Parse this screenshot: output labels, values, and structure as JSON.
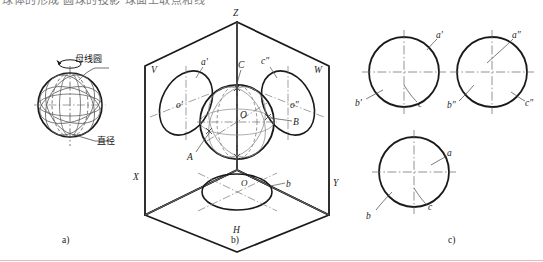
{
  "page": {
    "width": 543,
    "height": 262,
    "background": "#ffffff",
    "cut_text_top": "球体的形成 圆球的投影 球面上取点和线",
    "bottom_rule_color": "#e8b9bd"
  },
  "figure": {
    "caption_a": "a)",
    "caption_b": "b)",
    "caption_c": "c)"
  },
  "part_a": {
    "title": "sphere-formation",
    "label_generating_circle": "母线圆",
    "label_diameter": "直径",
    "sphere_center_x": 70,
    "sphere_center_y": 105,
    "sphere_radius": 32
  },
  "part_b": {
    "title": "three-projection-box",
    "axis_z": "Z",
    "axis_x": "X",
    "axis_y": "Y",
    "plane_v": "V",
    "plane_w": "W",
    "plane_h": "H",
    "point_a": "A",
    "point_b": "B",
    "point_c": "C",
    "center_o": "O",
    "front_ellipse_label": "a'",
    "front_center_label": "o'",
    "side_ellipse_label": "c″",
    "side_center_label": "o″",
    "top_ellipse_label": "b",
    "top_center_label": "O",
    "sphere_center_x": 237,
    "sphere_center_y": 122,
    "sphere_radius": 37
  },
  "part_c": {
    "title": "three-views",
    "views": [
      {
        "name": "front-view",
        "cx": 404,
        "cy": 72,
        "r": 35,
        "labels": [
          "a'",
          "b'",
          "c'"
        ]
      },
      {
        "name": "side-view",
        "cx": 492,
        "cy": 72,
        "r": 35,
        "labels": [
          "a″",
          "b″",
          "c″"
        ]
      },
      {
        "name": "top-view",
        "cx": 414,
        "cy": 172,
        "r": 35,
        "labels": [
          "a",
          "b",
          "c"
        ]
      }
    ]
  },
  "colors": {
    "outline": "#1a1a1a",
    "thin": "#6e6e6e",
    "construction": "#8a8a8a",
    "centerline": "#777777",
    "leader": "#555555"
  }
}
